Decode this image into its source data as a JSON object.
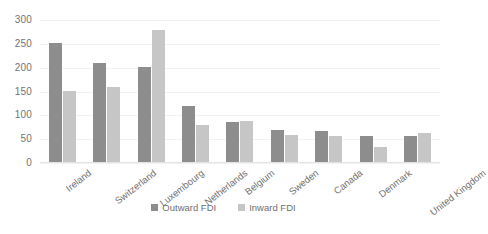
{
  "chart_data": {
    "type": "bar",
    "title": "",
    "subtitle": "",
    "xlabel": "",
    "ylabel": "",
    "categories": [
      "Ireland",
      "Switzerland",
      "Luxembourg",
      "Netherlands",
      "Belgium",
      "Sweden",
      "Canada",
      "Denmark",
      "United Kingdom"
    ],
    "series": [
      {
        "name": "Outward FDI",
        "color": "#8d8d8d",
        "values": [
          252,
          209,
          202,
          120,
          86,
          69,
          68,
          56,
          57
        ]
      },
      {
        "name": "Inward FDI",
        "color": "#c6c6c6",
        "values": [
          151,
          160,
          279,
          80,
          89,
          59,
          57,
          33,
          63
        ]
      }
    ],
    "yticks": [
      0,
      50,
      100,
      150,
      200,
      250,
      300
    ],
    "ylim": [
      0,
      300
    ],
    "grid": true,
    "legend_position": "bottom"
  },
  "legend": {
    "items": [
      {
        "label": "Outward FDI",
        "swatch": "outward"
      },
      {
        "label": "Inward FDI",
        "swatch": "inward"
      }
    ]
  }
}
